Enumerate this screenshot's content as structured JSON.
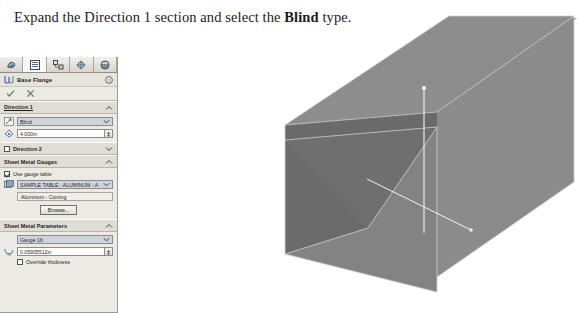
{
  "instruction": {
    "before": "Expand the Direction 1 section and select the ",
    "bold": "Blind",
    "after": " type."
  },
  "property_manager": {
    "tabs": [
      {
        "name": "feature-manager-tab",
        "icon": "feature-tree-icon",
        "active": false
      },
      {
        "name": "property-manager-tab",
        "icon": "property-list-icon",
        "active": true
      },
      {
        "name": "configuration-manager-tab",
        "icon": "configuration-icon",
        "active": false
      },
      {
        "name": "dimxpert-manager-tab",
        "icon": "dimxpert-target-icon",
        "active": false
      },
      {
        "name": "display-manager-tab",
        "icon": "appearance-sphere-icon",
        "active": false
      }
    ],
    "title": "Base Flange",
    "title_icon": "base-flange-icon",
    "help_icon": "help-question-icon",
    "confirm_icon": "check-icon",
    "cancel_icon": "cancel-x-icon",
    "sections": {
      "direction1": {
        "label": "Direction 1",
        "collapse_state": "expanded",
        "end_condition_icon": "end-condition-icon",
        "end_condition_value": "Blind",
        "depth_icon": "depth-dimension-icon",
        "depth_value": "4.000in"
      },
      "direction2": {
        "label": "Direction 2",
        "checked": false,
        "collapse_state": "collapsed"
      },
      "sheet_metal_gauges": {
        "label": "Sheet Metal Gauges",
        "collapse_state": "expanded",
        "use_gauge_table_label": "Use gauge table",
        "use_gauge_table_checked": true,
        "table_icon": "gauge-table-icon",
        "table_value": "SAMPLE TABLE - ALUMINUM - A",
        "material_value": "Aluminum - Coining",
        "browse_label": "Browse..."
      },
      "sheet_metal_parameters": {
        "label": "Sheet Metal Parameters",
        "collapse_state": "expanded",
        "gauge_value": "Gauge 16",
        "thickness_icon": "thickness-icon",
        "thickness_value": "0.05905512in",
        "override_thickness_label": "Override thickness",
        "override_thickness_checked": false
      }
    }
  },
  "callout": {
    "name": "pointer-arrow-annotation",
    "target": "Sheet Metal Parameters"
  },
  "viewport": {
    "name": "3d-model-viewport",
    "model": "sheet-metal-u-channel",
    "colors": {
      "face_top": "#8a8a8a",
      "face_left_dark": "#6f6f6f",
      "face_front": "#828282",
      "face_right": "#888888",
      "edge": "#d8d8d8",
      "axis": "#f2f2f2"
    },
    "axes": [
      "vertical-axis-line",
      "horizontal-axis-line"
    ]
  }
}
